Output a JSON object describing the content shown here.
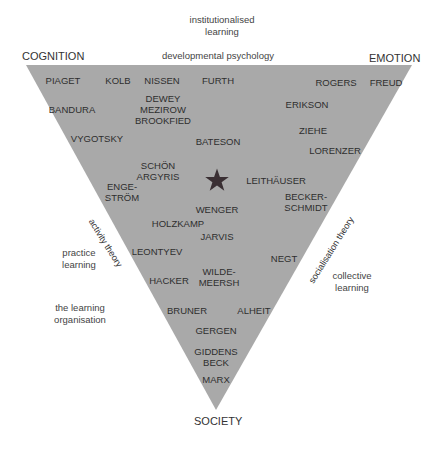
{
  "diagram": {
    "type": "learning-theory-triangle",
    "colors": {
      "triangle_fill": "#a9a9a9",
      "text": "#2e2e2e",
      "star": "#3a2f33",
      "background": "#ffffff"
    },
    "corners": {
      "top_left": "COGNITION",
      "top_right": "EMOTION",
      "bottom": "SOCIETY"
    },
    "edges": {
      "top": "developmental psychology",
      "left": "activity theory",
      "right": "socialisation theory"
    },
    "outside_notes": {
      "top": "institutionalised\nlearning",
      "left_upper": "practice\nlearning",
      "left_lower": "the learning\norganisation",
      "right": "collective\nlearning"
    },
    "center_marker": "star-icon",
    "theorists": [
      {
        "name": "PIAGET",
        "x": 63,
        "y": 75
      },
      {
        "name": "KOLB",
        "x": 118,
        "y": 75
      },
      {
        "name": "NISSEN",
        "x": 162,
        "y": 75
      },
      {
        "name": "FURTH",
        "x": 218,
        "y": 75
      },
      {
        "name": "ROGERS",
        "x": 336,
        "y": 77
      },
      {
        "name": "FREUD",
        "x": 386,
        "y": 77
      },
      {
        "name": "DEWEY\nMEZIROW\nBROOKFIED",
        "x": 163,
        "y": 93
      },
      {
        "name": "BANDURA",
        "x": 72,
        "y": 104
      },
      {
        "name": "ERIKSON",
        "x": 307,
        "y": 99
      },
      {
        "name": "ZIEHE",
        "x": 313,
        "y": 125
      },
      {
        "name": "VYGOTSKY",
        "x": 97,
        "y": 133
      },
      {
        "name": "BATESON",
        "x": 218,
        "y": 136
      },
      {
        "name": "LORENZER",
        "x": 335,
        "y": 145
      },
      {
        "name": "SCHÖN\nARGYRIS",
        "x": 158,
        "y": 160
      },
      {
        "name": "LEITHÄUSER",
        "x": 276,
        "y": 175
      },
      {
        "name": "ENGE-\nSTRÖM",
        "x": 122,
        "y": 181
      },
      {
        "name": "BECKER-\nSCHMIDT",
        "x": 306,
        "y": 191
      },
      {
        "name": "WENGER",
        "x": 217,
        "y": 204
      },
      {
        "name": "HOLZKAMP",
        "x": 178,
        "y": 218
      },
      {
        "name": "JARVIS",
        "x": 217,
        "y": 231
      },
      {
        "name": "LEONTYEV",
        "x": 157,
        "y": 246
      },
      {
        "name": "NEGT",
        "x": 284,
        "y": 253
      },
      {
        "name": "WILDE-\nMEERSH",
        "x": 219,
        "y": 266
      },
      {
        "name": "HACKER",
        "x": 169,
        "y": 275
      },
      {
        "name": "BRUNER",
        "x": 187,
        "y": 305
      },
      {
        "name": "ALHEIT",
        "x": 254,
        "y": 305
      },
      {
        "name": "GERGEN",
        "x": 216,
        "y": 325
      },
      {
        "name": "GIDDENS\nBECK",
        "x": 216,
        "y": 346
      },
      {
        "name": "MARX",
        "x": 216,
        "y": 374
      }
    ]
  }
}
